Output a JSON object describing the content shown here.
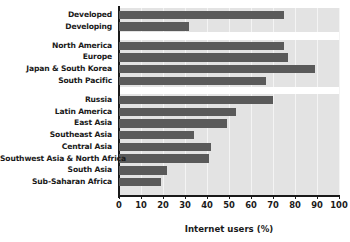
{
  "chart_data": {
    "type": "bar",
    "orientation": "horizontal",
    "title": "",
    "xlabel": "Internet users (%)",
    "ylabel": "",
    "xlim": [
      0,
      100
    ],
    "xticks": [
      0,
      10,
      20,
      30,
      40,
      50,
      60,
      70,
      80,
      90,
      100
    ],
    "grid": true,
    "legend": null,
    "bar_color": "#5a5a5a",
    "plot_background": "#e3e3e3",
    "categories": [
      "Developed",
      "Developing",
      "North America",
      "Europe",
      "Japan & South Korea",
      "South Pacific",
      "Russia",
      "Latin America",
      "East Asia",
      "Southeast Asia",
      "Central Asia",
      "Southwest Asia & North Africa",
      "South Asia",
      "Sub-Saharan Africa"
    ],
    "values": [
      75,
      32,
      75,
      77,
      89,
      67,
      70,
      53,
      49,
      34,
      42,
      41,
      22,
      19
    ],
    "groups": [
      {
        "name": "",
        "categories": [
          "Developed",
          "Developing"
        ]
      },
      {
        "name": "",
        "categories": [
          "North America",
          "Europe",
          "Japan & South Korea",
          "South Pacific"
        ]
      },
      {
        "name": "",
        "categories": [
          "Russia",
          "Latin America",
          "East Asia",
          "Southeast Asia",
          "Central Asia",
          "Southwest Asia & North Africa",
          "South Asia",
          "Sub-Saharan Africa"
        ]
      }
    ]
  }
}
